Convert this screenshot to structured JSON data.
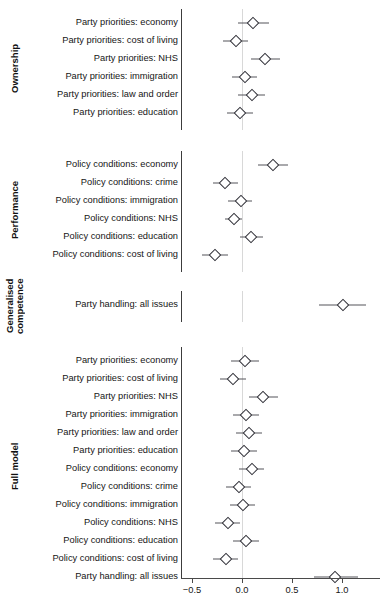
{
  "figure": {
    "type": "forest-plot",
    "background": "#ffffff",
    "point_color": "#2b2b33",
    "line_color": "#55555a",
    "zero_line_color": "#d8d8d8"
  },
  "axis": {
    "tick_labels": [
      "−0.5",
      "0.0",
      "0.5",
      "1.0"
    ],
    "tick_values": [
      -0.5,
      0.0,
      0.5,
      1.0
    ],
    "xlim": [
      -0.62,
      1.4
    ],
    "zero_reference": 0.0
  },
  "groups": [
    {
      "label": "Ownership"
    },
    {
      "label": "Performance"
    },
    {
      "label": "Generalised\ncompetence"
    },
    {
      "label": "Full model"
    }
  ],
  "chart_data": {
    "type": "scatter",
    "title": "",
    "xlabel": "",
    "ylabel": "",
    "xlim": [
      -0.62,
      1.4
    ],
    "xticks": [
      -0.5,
      0.0,
      0.5,
      1.0
    ],
    "xtick_labels": [
      "−0.5",
      "0.0",
      "0.5",
      "1.0"
    ],
    "grid": false,
    "legend": "none",
    "zero_reference_line": 0.0,
    "error_bar_style": "95% confidence interval",
    "panels": [
      {
        "group": "Ownership",
        "rows": [
          {
            "label": "Party priorities: economy",
            "estimate": 0.11,
            "ci_low": -0.04,
            "ci_high": 0.27
          },
          {
            "label": "Party priorities: cost of living",
            "estimate": -0.06,
            "ci_low": -0.19,
            "ci_high": 0.06
          },
          {
            "label": "Party priorities: NHS",
            "estimate": 0.23,
            "ci_low": 0.09,
            "ci_high": 0.38
          },
          {
            "label": "Party priorities: immigration",
            "estimate": 0.03,
            "ci_low": -0.1,
            "ci_high": 0.15
          },
          {
            "label": "Party priorities: law and order",
            "estimate": 0.1,
            "ci_low": -0.04,
            "ci_high": 0.23
          },
          {
            "label": "Party priorities: education",
            "estimate": -0.02,
            "ci_low": -0.15,
            "ci_high": 0.11
          }
        ]
      },
      {
        "group": "Performance",
        "rows": [
          {
            "label": "Policy conditions: economy",
            "estimate": 0.31,
            "ci_low": 0.16,
            "ci_high": 0.46
          },
          {
            "label": "Policy conditions: crime",
            "estimate": -0.17,
            "ci_low": -0.29,
            "ci_high": -0.04
          },
          {
            "label": "Policy conditions: immigration",
            "estimate": -0.01,
            "ci_low": -0.14,
            "ci_high": 0.1
          },
          {
            "label": "Policy conditions: NHS",
            "estimate": -0.08,
            "ci_low": -0.17,
            "ci_high": 0.0
          },
          {
            "label": "Policy conditions: education",
            "estimate": 0.09,
            "ci_low": -0.02,
            "ci_high": 0.21
          },
          {
            "label": "Policy conditions: cost of living",
            "estimate": -0.27,
            "ci_low": -0.4,
            "ci_high": -0.14
          }
        ]
      },
      {
        "group": "Generalised competence",
        "rows": [
          {
            "label": "Party handling: all issues",
            "estimate": 1.01,
            "ci_low": 0.77,
            "ci_high": 1.24
          }
        ]
      },
      {
        "group": "Full model",
        "rows": [
          {
            "label": "Party priorities: economy",
            "estimate": 0.03,
            "ci_low": -0.11,
            "ci_high": 0.17
          },
          {
            "label": "Party priorities: cost of living",
            "estimate": -0.09,
            "ci_low": -0.22,
            "ci_high": 0.04
          },
          {
            "label": "Party priorities: NHS",
            "estimate": 0.21,
            "ci_low": 0.07,
            "ci_high": 0.36
          },
          {
            "label": "Party priorities: immigration",
            "estimate": 0.04,
            "ci_low": -0.09,
            "ci_high": 0.17
          },
          {
            "label": "Party priorities: law and order",
            "estimate": 0.07,
            "ci_low": -0.06,
            "ci_high": 0.2
          },
          {
            "label": "Party priorities: education",
            "estimate": 0.02,
            "ci_low": -0.11,
            "ci_high": 0.15
          },
          {
            "label": "Policy conditions: economy",
            "estimate": 0.1,
            "ci_low": -0.03,
            "ci_high": 0.22
          },
          {
            "label": "Policy conditions: crime",
            "estimate": -0.03,
            "ci_low": -0.16,
            "ci_high": 0.09
          },
          {
            "label": "Policy conditions: immigration",
            "estimate": 0.01,
            "ci_low": -0.12,
            "ci_high": 0.13
          },
          {
            "label": "Policy conditions: NHS",
            "estimate": -0.14,
            "ci_low": -0.27,
            "ci_high": -0.02
          },
          {
            "label": "Policy conditions: education",
            "estimate": 0.04,
            "ci_low": -0.09,
            "ci_high": 0.17
          },
          {
            "label": "Policy conditions: cost of living",
            "estimate": -0.16,
            "ci_low": -0.29,
            "ci_high": -0.04
          },
          {
            "label": "Party handling: all issues",
            "estimate": 0.93,
            "ci_low": 0.72,
            "ci_high": 1.16
          }
        ]
      }
    ]
  }
}
